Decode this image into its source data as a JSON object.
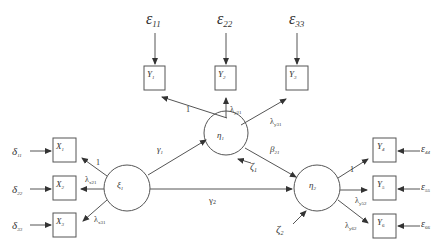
{
  "diagram": {
    "type": "structural-equation-model",
    "colors": {
      "stroke": "#555555",
      "text": "#333333",
      "background": "#ffffff"
    },
    "latent": {
      "xi1": {
        "label": "ξ",
        "sub": "1"
      },
      "eta1": {
        "label": "η",
        "sub": "1"
      },
      "eta2": {
        "label": "η",
        "sub": "2"
      }
    },
    "indicators": {
      "x1": {
        "label": "X",
        "sub": "1"
      },
      "x2": {
        "label": "X",
        "sub": "2"
      },
      "x3": {
        "label": "X",
        "sub": "3"
      },
      "y1": {
        "label": "Y",
        "sub": "1"
      },
      "y2": {
        "label": "Y",
        "sub": "2"
      },
      "y3": {
        "label": "Y",
        "sub": "3"
      },
      "y4": {
        "label": "Y",
        "sub": "4"
      },
      "y5": {
        "label": "Y",
        "sub": "5"
      },
      "y6": {
        "label": "Y",
        "sub": "6"
      }
    },
    "errors": {
      "eps11": {
        "label": "ε",
        "sub": "11"
      },
      "eps22": {
        "label": "ε",
        "sub": "22"
      },
      "eps33": {
        "label": "ε",
        "sub": "33"
      },
      "eps44": {
        "label": "ε",
        "sub": "44"
      },
      "eps55": {
        "label": "ε",
        "sub": "55"
      },
      "eps66": {
        "label": "ε",
        "sub": "66"
      },
      "delta11": {
        "label": "δ",
        "sub": "11"
      },
      "delta22": {
        "label": "δ",
        "sub": "22"
      },
      "delta33": {
        "label": "δ",
        "sub": "33"
      },
      "zeta1": {
        "label": "ζ",
        "sub": "1"
      },
      "zeta2": {
        "label": "ζ",
        "sub": "2"
      }
    },
    "paths": {
      "xi1_x1": {
        "label": "1",
        "sub": ""
      },
      "xi1_x2": {
        "label": "λ",
        "sub": "x21"
      },
      "xi1_x3": {
        "label": "λ",
        "sub": "x31"
      },
      "eta1_y1": {
        "label": "1",
        "sub": ""
      },
      "eta1_y2": {
        "label": "λ",
        "sub": "y21"
      },
      "eta1_y3": {
        "label": "λ",
        "sub": "y31"
      },
      "eta2_y4": {
        "label": "1",
        "sub": ""
      },
      "eta2_y5": {
        "label": "λ",
        "sub": "y52"
      },
      "eta2_y6": {
        "label": "λ",
        "sub": "y62"
      },
      "xi1_eta1": {
        "label": "γ",
        "sub": "1"
      },
      "xi1_eta2": {
        "label": "γ",
        "sub": "2"
      },
      "eta1_eta2": {
        "label": "β",
        "sub": "21"
      }
    }
  }
}
